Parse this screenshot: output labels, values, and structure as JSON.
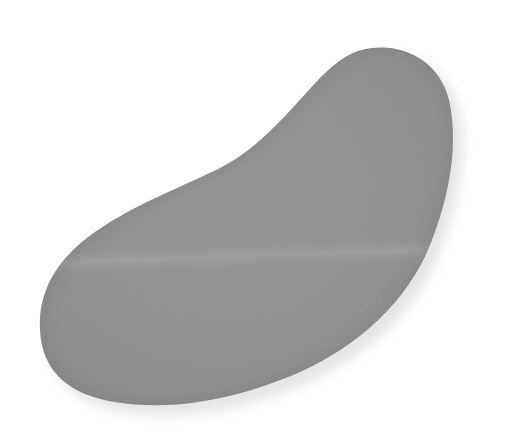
{
  "image": {
    "subject": "gray bean-shaped pebble",
    "background_color": "#ffffff",
    "stone_color": "#8f8f8f",
    "stone_highlight": "#a0a0a0",
    "stone_shadow": "#7c7c7c",
    "cast_shadow_color": "#d8d8d8"
  }
}
